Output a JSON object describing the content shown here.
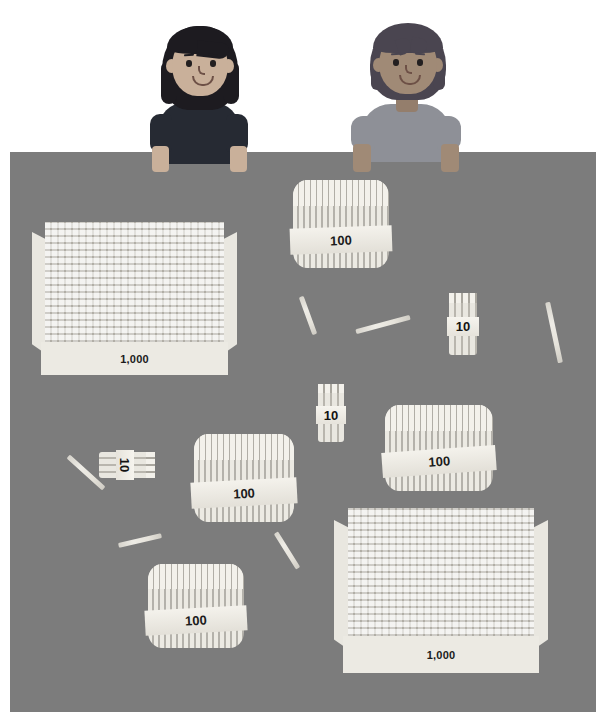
{
  "scene": {
    "title": "Base-ten sticks on a table with two children",
    "background_color": "#ffffff",
    "table_color": "#7c7c7c",
    "stick_color": "#e6e3db"
  },
  "children": [
    {
      "name": "girl-left",
      "hair_color": "#1d1b20",
      "skin_color": "#c9b09a",
      "shirt_color": "#262a33",
      "position": {
        "left": 142,
        "top": 18
      }
    },
    {
      "name": "boy-right",
      "hair_color": "#4a4550",
      "skin_color": "#a08a76",
      "shirt_color": "#8e9097",
      "position": {
        "left": 345,
        "top": 18
      }
    }
  ],
  "manipulatives": {
    "boxes_1000": [
      {
        "label": "1,000",
        "value": 1000,
        "left": 32,
        "top": 222,
        "width": 205,
        "height": 153
      },
      {
        "label": "1,000",
        "top": 508,
        "value": 1000,
        "left": 334,
        "width": 214,
        "height": 165
      }
    ],
    "bundles_100": [
      {
        "label": "100",
        "value": 100,
        "left": 293,
        "top": 180,
        "width": 96,
        "height": 88
      },
      {
        "label": "100",
        "value": 100,
        "left": 385,
        "top": 405,
        "width": 108,
        "height": 86
      },
      {
        "label": "100",
        "value": 100,
        "left": 194,
        "top": 434,
        "width": 100,
        "height": 88
      },
      {
        "label": "100",
        "value": 100,
        "left": 148,
        "top": 564,
        "width": 96,
        "height": 84
      }
    ],
    "bundles_10": [
      {
        "label": "10",
        "value": 10,
        "left": 449,
        "top": 293,
        "width": 28,
        "height": 62,
        "rotation": 0
      },
      {
        "label": "10",
        "value": 10,
        "left": 318,
        "top": 384,
        "width": 26,
        "height": 58,
        "rotation": 0
      },
      {
        "label": "10",
        "value": 10,
        "left": 114,
        "top": 437,
        "width": 26,
        "height": 56,
        "rotation": 90
      }
    ],
    "loose_sticks": [
      {
        "left": 288,
        "top": 313,
        "length": 40,
        "rotation": 70
      },
      {
        "left": 355,
        "top": 315,
        "length": 56,
        "rotation": -15
      },
      {
        "left": 523,
        "top": 327,
        "length": 62,
        "rotation": 11
      },
      {
        "left": 62,
        "top": 465,
        "length": 48,
        "rotation": 40
      },
      {
        "left": 120,
        "top": 538,
        "length": 44,
        "rotation": -13
      },
      {
        "left": 270,
        "top": 545,
        "length": 42,
        "rotation": 56
      },
      {
        "left": 462,
        "top": 258,
        "length": 0,
        "rotation": 0
      }
    ],
    "totals": {
      "thousands": 2,
      "hundreds": 4,
      "tens": 3,
      "ones": 6
    }
  }
}
